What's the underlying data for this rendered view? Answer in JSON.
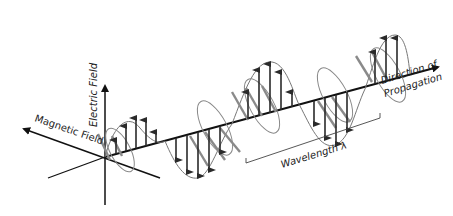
{
  "diagram": {
    "labels": {
      "electric_field": "Electric Field",
      "magnetic_field": "Magnetic Field",
      "direction_line1": "Direction of",
      "direction_line2": "Propagation",
      "wavelength": "Wavelength λ"
    },
    "colors": {
      "axis": "#111111",
      "electric_arrow": "#2a2a2a",
      "magnetic_arrow": "#8a8a8a",
      "envelope": "#777777"
    }
  }
}
